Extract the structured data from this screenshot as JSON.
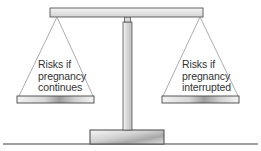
{
  "diagram": {
    "type": "balance-scale",
    "left_pan": {
      "label_lines": [
        "Risks if",
        "pregnancy",
        "continues"
      ]
    },
    "right_pan": {
      "label_lines": [
        "Risks if",
        "pregnancy",
        "interrupted"
      ]
    },
    "colors": {
      "outline": "#444444",
      "string": "#888888",
      "bar_light": "#f4f4f4",
      "bar_mid": "#c8c8c8",
      "bar_dark": "#9a9a9a",
      "text": "#333333"
    }
  }
}
